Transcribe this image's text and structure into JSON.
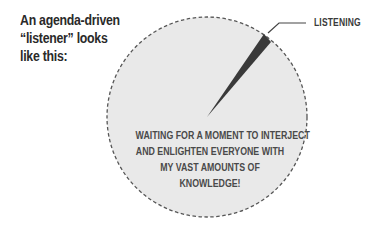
{
  "intro_text": {
    "line1": "An agenda-driven",
    "line2": "“listener” looks",
    "line3": "like this:"
  },
  "diagram": {
    "type": "pie",
    "slice_label": "LISTENING",
    "body_lines": [
      "WAITING FOR A MOMENT TO INTERJECT",
      "AND ENLIGHTEN EVERYONE WITH",
      "MY VAST AMOUNTS OF",
      "KNOWLEDGE!"
    ],
    "colors": {
      "circle_fill": "#e9e9e9",
      "circle_border": "#555555",
      "slice_fill": "#3a3a3a",
      "text": "#4a4a4a"
    }
  }
}
